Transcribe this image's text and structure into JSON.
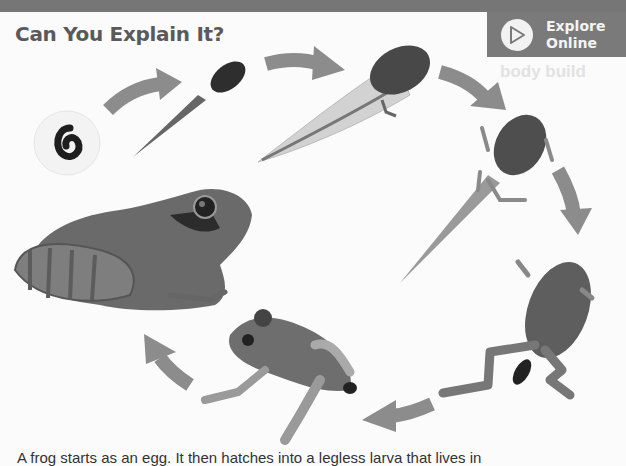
{
  "header": {
    "title": "Can You Explain It?",
    "explore_button": {
      "line1": "Explore",
      "line2": "Online",
      "icon": "play-icon"
    }
  },
  "figure": {
    "stages": [
      {
        "name": "egg",
        "icon": "frog-egg-image"
      },
      {
        "name": "young tadpole",
        "icon": "young-tadpole-image"
      },
      {
        "name": "tadpole with hind legs",
        "icon": "tadpole-hind-legs-image"
      },
      {
        "name": "tadpole with four legs",
        "icon": "tadpole-four-legs-image"
      },
      {
        "name": "froglet losing tail",
        "icon": "froglet-image"
      },
      {
        "name": "young frog",
        "icon": "young-frog-image"
      },
      {
        "name": "adult frog",
        "icon": "adult-frog-image"
      }
    ],
    "arrow_color": "#8c8c8c"
  },
  "body_text": {
    "caption": "A frog starts as an egg. It then hatches into a legless larva that lives in"
  },
  "ghost_text": {
    "line1": "body build"
  },
  "colors": {
    "topbar": "#767676",
    "button_bg": "#7a7a7a",
    "title": "#5a5a5a",
    "background": "#fbfbfb"
  }
}
